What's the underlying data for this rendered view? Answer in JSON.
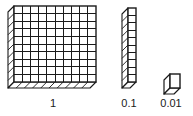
{
  "figure": {
    "background_color": "#ffffff",
    "line_color": "#1a1a1a",
    "face_color": "#ffffff"
  },
  "blocks": [
    {
      "id": "flat",
      "name": "hundred-flat",
      "label": "1",
      "grid_rows": 10,
      "grid_cols": 10,
      "unit_count": 100,
      "shape": "flat"
    },
    {
      "id": "rod",
      "name": "ten-rod",
      "label": "0.1",
      "grid_rows": 10,
      "grid_cols": 1,
      "unit_count": 10,
      "shape": "rod"
    },
    {
      "id": "cube",
      "name": "unit-cube",
      "label": "0.01",
      "grid_rows": 1,
      "grid_cols": 1,
      "unit_count": 1,
      "shape": "cube"
    }
  ],
  "labels": {
    "one": "1",
    "tenth": "0.1",
    "hundredth": "0.01"
  }
}
